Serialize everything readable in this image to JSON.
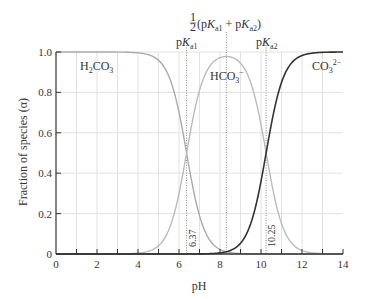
{
  "chart_data": {
    "type": "line",
    "title": "",
    "xlabel": "pH",
    "ylabel": "Fraction of species (α)",
    "xlim": [
      0,
      14
    ],
    "ylim": [
      0,
      1.0
    ],
    "x_ticks": [
      0,
      2,
      4,
      6,
      8,
      10,
      12,
      14
    ],
    "x_minor_ticks": [
      1,
      3,
      5,
      7,
      9,
      11,
      13
    ],
    "y_ticks": [
      0,
      0.2,
      0.4,
      0.6,
      0.8,
      1.0
    ],
    "x_tick_labels": [
      "0",
      "2",
      "4",
      "6",
      "8",
      "10",
      "12",
      "14"
    ],
    "y_tick_labels": [
      "0",
      "0.2",
      "0.4",
      "0.6",
      "0.8",
      "1.0"
    ],
    "grid": true,
    "legend": null,
    "pKa1": 6.37,
    "pKa2": 10.25,
    "series": [
      {
        "name": "H2CO3",
        "color": "#aaaaaa",
        "x": [
          0,
          2,
          4,
          5,
          5.5,
          6,
          6.37,
          7,
          7.5,
          8,
          9,
          10,
          12,
          14
        ],
        "values": [
          1.0,
          1.0,
          1.0,
          0.96,
          0.88,
          0.7,
          0.5,
          0.19,
          0.07,
          0.02,
          0.002,
          0.0,
          0.0,
          0.0
        ]
      },
      {
        "name": "HCO3-",
        "color": "#bbbbbb",
        "x": [
          0,
          3,
          4,
          5,
          6,
          6.37,
          7,
          8,
          8.31,
          9,
          10,
          10.25,
          11,
          12,
          13,
          14
        ],
        "values": [
          0.0,
          0.001,
          0.004,
          0.04,
          0.3,
          0.5,
          0.81,
          0.97,
          0.98,
          0.94,
          0.64,
          0.5,
          0.15,
          0.02,
          0.002,
          0.0
        ]
      },
      {
        "name": "CO3 2-",
        "color": "#333333",
        "x": [
          0,
          6,
          7,
          8,
          8.31,
          9,
          10,
          10.25,
          11,
          12,
          13,
          14
        ],
        "values": [
          0.0,
          0.0,
          0.0,
          0.006,
          0.011,
          0.05,
          0.36,
          0.5,
          0.85,
          0.98,
          1.0,
          1.0
        ]
      }
    ],
    "annotations": [
      {
        "text": "pKa1",
        "x": 6.37
      },
      {
        "text": "pKa2",
        "x": 10.25
      },
      {
        "text": "½(pKa1 + pKa2)",
        "x": 8.31
      },
      {
        "text": "6.37",
        "x": 6.37,
        "rotated": true
      },
      {
        "text": "10.25",
        "x": 10.25,
        "rotated": true
      }
    ]
  },
  "labels": {
    "xlabel": "pH",
    "ylabel": "Fraction of species (α)",
    "h2co3_main": "H",
    "h2co3_sub1": "2",
    "h2co3_mid": "CO",
    "h2co3_sub2": "3",
    "hco3_main": "HCO",
    "hco3_sub": "3",
    "hco3_sup": "−",
    "co3_main": "CO",
    "co3_sub": "3",
    "co3_sup": "2−",
    "pka1_p": "p",
    "pka1_K": "K",
    "pka1_sub": "a1",
    "pka2_p": "p",
    "pka2_K": "K",
    "pka2_sub": "a2",
    "half_num": "1",
    "half_den": "2",
    "half_expr_open": "(p",
    "half_K1": "K",
    "half_sub1": "a1",
    "half_plus": " + p",
    "half_K2": "K",
    "half_sub2": "a2",
    "half_close": ")",
    "pka1_value": "6.37",
    "pka2_value": "10.25"
  }
}
